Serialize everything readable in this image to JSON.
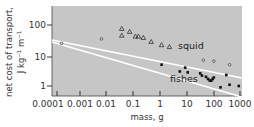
{
  "chart_data": {
    "type": "scatter",
    "title": "",
    "xlabel": "mass, g",
    "ylabel_line1": "net cost of transport,",
    "ylabel_line2": "J kg⁻¹ m⁻¹",
    "xscale": "log",
    "yscale": "log",
    "xlim": [
      0.0001,
      1000
    ],
    "ylim": [
      0.7,
      400
    ],
    "x_ticks": [
      "0.0001",
      "0.001",
      "0.01",
      "0.1",
      "1",
      "10",
      "100",
      "1000"
    ],
    "y_ticks": [
      "1",
      "10",
      "100"
    ],
    "grid": false,
    "background": "#c8c8c8",
    "series": [
      {
        "name": "squid",
        "marker": "triangle-open",
        "points": [
          [
            0.03,
            75
          ],
          [
            0.03,
            45
          ],
          [
            0.06,
            60
          ],
          [
            0.1,
            42
          ],
          [
            0.13,
            42
          ],
          [
            0.2,
            38
          ],
          [
            0.4,
            28
          ],
          [
            1.0,
            22
          ],
          [
            2.0,
            19
          ]
        ]
      },
      {
        "name": "squid (small, open circles)",
        "marker": "circle-open",
        "points": [
          [
            0.00015,
            25
          ],
          [
            0.005,
            35
          ],
          [
            40,
            7
          ],
          [
            100,
            6.5
          ],
          [
            400,
            5
          ]
        ]
      },
      {
        "name": "fishes",
        "marker": "square-filled",
        "points": [
          [
            1,
            5
          ],
          [
            5,
            3
          ],
          [
            8,
            4
          ],
          [
            10,
            2.8
          ],
          [
            30,
            2.6
          ],
          [
            35,
            2.2
          ],
          [
            50,
            2
          ],
          [
            60,
            1.7
          ],
          [
            70,
            1.5
          ],
          [
            80,
            1.5
          ],
          [
            90,
            1.7
          ],
          [
            100,
            1.9
          ],
          [
            180,
            0.9
          ],
          [
            300,
            2.3
          ],
          [
            400,
            1.1
          ],
          [
            900,
            1
          ]
        ]
      }
    ],
    "fit_lines": [
      {
        "name": "squid fit",
        "from": [
          0.0001,
          45
        ],
        "to": [
          1000,
          5
        ]
      },
      {
        "name": "fishes fit",
        "from": [
          0.0001,
          55
        ],
        "to": [
          1000,
          1
        ]
      }
    ],
    "annotations": [
      "squid",
      "fishes"
    ]
  }
}
